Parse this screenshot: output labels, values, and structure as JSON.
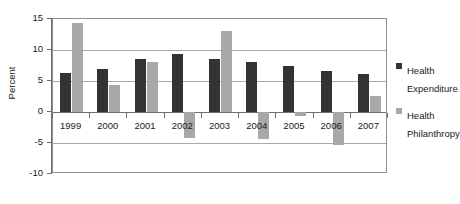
{
  "chart_data": {
    "type": "bar",
    "title": "",
    "xlabel": "",
    "ylabel": "Percent",
    "ylim": [
      -10,
      15
    ],
    "yticks": [
      15,
      10,
      5,
      0,
      -5,
      -10
    ],
    "ytick_labels": [
      "15",
      "10",
      "5",
      "0",
      "-5",
      "-10"
    ],
    "grid": true,
    "legend_position": "right",
    "categories": [
      "1999",
      "2000",
      "2001",
      "2002",
      "2003",
      "2004",
      "2005",
      "2006",
      "2007"
    ],
    "series": [
      {
        "name": "Health Expenditure",
        "color": "#333333",
        "values": [
          6.3,
          7.0,
          8.6,
          9.4,
          8.5,
          8.0,
          7.4,
          6.6,
          6.2
        ]
      },
      {
        "name": "Health Philanthropy",
        "color": "#a8a8a8",
        "values": [
          14.4,
          4.3,
          8.0,
          -4.2,
          13.0,
          -4.3,
          -0.7,
          -5.3,
          2.6
        ]
      }
    ]
  },
  "legend": {
    "items": [
      {
        "label": "Health Expenditure",
        "color": "#333333"
      },
      {
        "label": "Health Philanthropy",
        "color": "#a8a8a8"
      }
    ]
  }
}
